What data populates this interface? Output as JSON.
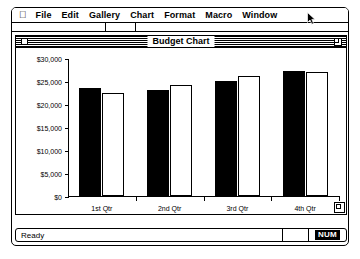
{
  "menu_bar": {
    "apple_icon": "apple-icon",
    "items": [
      {
        "label": "File"
      },
      {
        "label": "Edit"
      },
      {
        "label": "Gallery"
      },
      {
        "label": "Chart"
      },
      {
        "label": "Format"
      },
      {
        "label": "Macro"
      },
      {
        "label": "Window"
      }
    ]
  },
  "cursor": {
    "icon": "arrow-pointer-icon",
    "x": 305,
    "y": 14
  },
  "chart_window": {
    "title": "Budget Chart",
    "close_box": "close-box-icon",
    "zoom_box": "zoom-box-icon",
    "grow_box": "grow-box-icon"
  },
  "status_bar": {
    "message": "Ready",
    "num_lock": "NUM"
  },
  "colors": {
    "series_1": "#000000",
    "series_2": "#ffffff",
    "window_frame": "#000000",
    "background": "#ffffff"
  },
  "chart_data": {
    "type": "bar",
    "title": "Budget Chart",
    "xlabel": "",
    "ylabel": "",
    "categories": [
      "1st Qtr",
      "2nd Qtr",
      "3rd Qtr",
      "4th Qtr"
    ],
    "series": [
      {
        "name": "Series 1",
        "color": "#000000",
        "values": [
          23500,
          23100,
          25100,
          27200
        ]
      },
      {
        "name": "Series 2",
        "color": "#ffffff",
        "values": [
          22300,
          24200,
          26000,
          27000
        ]
      }
    ],
    "ylim": [
      0,
      30000
    ],
    "ytick_values": [
      0,
      5000,
      10000,
      15000,
      20000,
      25000,
      30000
    ],
    "ytick_labels": [
      "$0",
      "$5,000",
      "$10,000",
      "$15,000",
      "$20,000",
      "$25,000",
      "$30,000"
    ],
    "grid": false,
    "legend": "none"
  }
}
